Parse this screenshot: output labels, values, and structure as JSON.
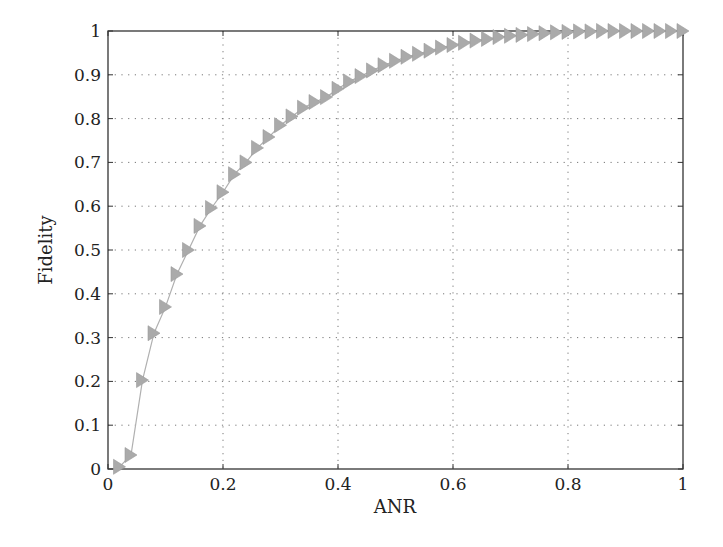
{
  "chart_data": {
    "type": "line",
    "title": "",
    "xlabel": "ANR",
    "ylabel": "Fidelity",
    "xlim": [
      0,
      1
    ],
    "ylim": [
      0,
      1
    ],
    "grid": true,
    "grid_style": "dotted",
    "legend": null,
    "x_ticks": [
      "0",
      "0.2",
      "0.4",
      "0.6",
      "0.8",
      "1"
    ],
    "y_ticks": [
      "0",
      "0.1",
      "0.2",
      "0.3",
      "0.4",
      "0.5",
      "0.6",
      "0.7",
      "0.8",
      "0.9",
      "1"
    ],
    "series": [
      {
        "name": "Fidelity vs ANR",
        "color": "#aaaaaa",
        "line_color": "#b0b0b0",
        "marker": "triangle-right",
        "x": [
          0.02,
          0.04,
          0.06,
          0.08,
          0.1,
          0.12,
          0.14,
          0.16,
          0.18,
          0.2,
          0.22,
          0.24,
          0.26,
          0.28,
          0.3,
          0.32,
          0.34,
          0.36,
          0.38,
          0.4,
          0.42,
          0.44,
          0.46,
          0.48,
          0.5,
          0.52,
          0.54,
          0.56,
          0.58,
          0.6,
          0.62,
          0.64,
          0.66,
          0.68,
          0.7,
          0.72,
          0.74,
          0.76,
          0.78,
          0.8,
          0.82,
          0.84,
          0.86,
          0.88,
          0.9,
          0.92,
          0.94,
          0.96,
          0.98,
          1.0
        ],
        "values": [
          0.005,
          0.032,
          0.203,
          0.31,
          0.37,
          0.445,
          0.5,
          0.555,
          0.596,
          0.632,
          0.673,
          0.7,
          0.733,
          0.758,
          0.785,
          0.805,
          0.825,
          0.838,
          0.849,
          0.868,
          0.885,
          0.897,
          0.91,
          0.922,
          0.932,
          0.941,
          0.948,
          0.955,
          0.962,
          0.968,
          0.973,
          0.978,
          0.982,
          0.986,
          0.989,
          0.991,
          0.993,
          0.995,
          0.997,
          0.998,
          0.999,
          0.999,
          1.0,
          1.0,
          1.0,
          1.0,
          1.0,
          1.0,
          1.0,
          1.0
        ]
      }
    ]
  }
}
